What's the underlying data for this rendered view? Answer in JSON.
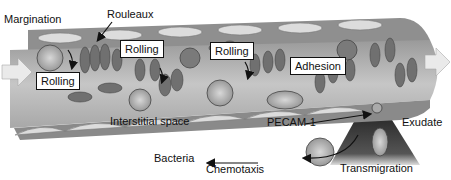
{
  "labels": {
    "margination": "Margination",
    "rouleaux": "Rouleaux",
    "interstitial_space": "Interstitial space",
    "pecam": "PECAM-1",
    "exudate": "Exudate",
    "bacteria": "Bacteria",
    "chemotaxis": "Chemotaxis",
    "transmigration": "Transmigration"
  },
  "stage_boxes": [
    {
      "label": "Rolling"
    },
    {
      "label": "Rolling"
    },
    {
      "label": "Rolling"
    },
    {
      "label": "Adhesion"
    }
  ],
  "colors": {
    "vessel_wall": "#8a8a8a",
    "vessel_lumen": "#b9b9b9",
    "endothelium": "#d8d8d8",
    "rbc": "#6e6e6e",
    "leukocyte": "#a5a5a5",
    "flow_arrow": "#e6e6e6",
    "exudate": "#3a3a3a"
  }
}
